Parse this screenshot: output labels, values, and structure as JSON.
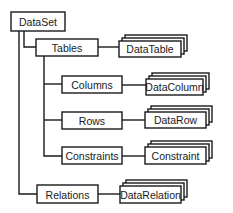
{
  "diagram": {
    "root": {
      "label": "DataSet"
    },
    "collections": [
      {
        "label": "Tables",
        "item": "DataTable"
      },
      {
        "label": "Columns",
        "item": "DataColumn"
      },
      {
        "label": "Rows",
        "item": "DataRow"
      },
      {
        "label": "Constraints",
        "item": "Constraint"
      },
      {
        "label": "Relations",
        "item": "DataRelation"
      }
    ]
  },
  "colors": {
    "stroke": "#1a1a1a",
    "fill": "#ffffff"
  }
}
